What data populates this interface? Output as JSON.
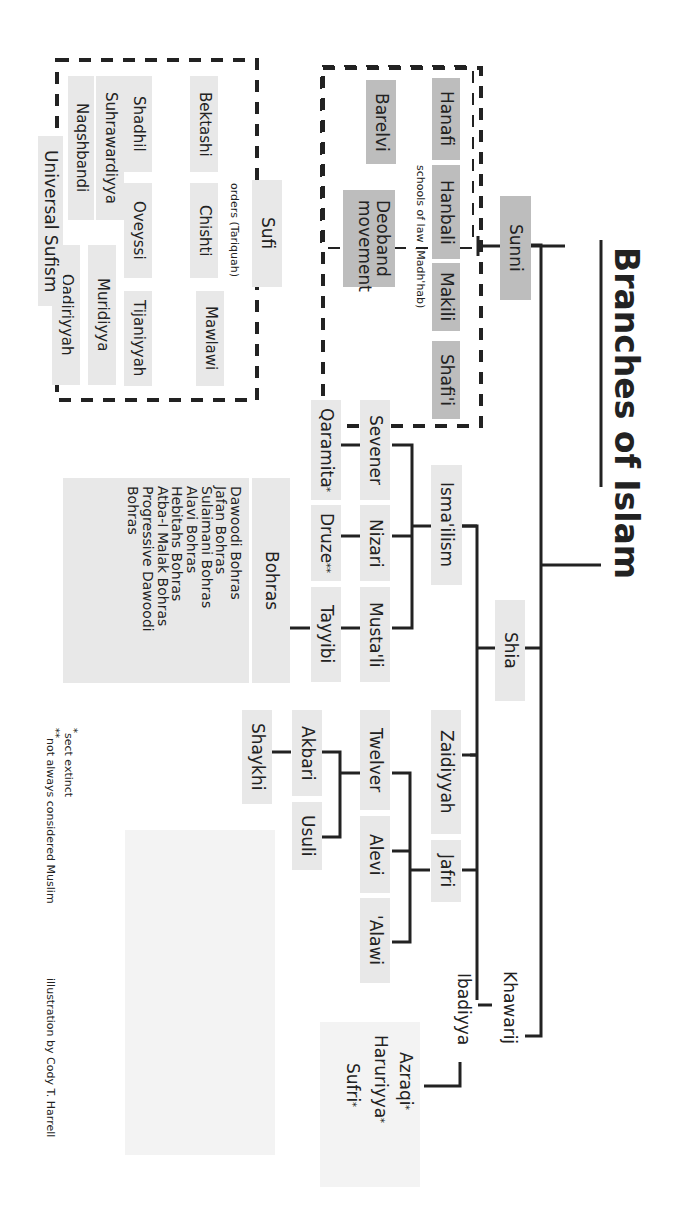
{
  "title": "Branches of Islam",
  "nodes": {
    "sunni": "Sunni",
    "shia": "Shia",
    "khawarij": "Khawarij",
    "schools_caption": "schools of law (Madh'hab)",
    "hanafi": "Hanafi",
    "hanbali": "Hanbali",
    "makili": "Makili",
    "shafii": "Shafi'i",
    "barelvi": "Barelvi",
    "deoband": "Deoband\nmovement",
    "sufi": "Sufi",
    "orders_caption": "orders (Tariquah)",
    "sufi_orders": [
      "Bektashi",
      "Chishti",
      "Mawlawi",
      "Shadhil",
      "Oveyssi",
      "Tijaniyyah",
      "Suhrawardiyya",
      "Muridiyya",
      "Naqshbandi",
      "Qadiriyyah"
    ],
    "universal_sufism": "Universal Sufism",
    "ismailism": "Isma'ilism",
    "sevener": "Sevener",
    "nizari": "Nizari",
    "mustali": "Musta'li",
    "qaramita": "Qaramita",
    "druze": "Druze",
    "tayyibi": "Tayyibi",
    "bohras": "Bohras",
    "bohras_list": "Dawoodi Bohras\nJafan Bohras\nSulaimani Bohras\nAlavi Bohras\nHebitahs Bohras\nAtba-I Malak Bohras\nProgressive Dawoodi\nBohras",
    "zaidiyyah": "Zaidiyyah",
    "jafri": "Jafri",
    "twelver": "Twelver",
    "alevi": "Alevi",
    "alawi": "'Alawi",
    "akbari": "Akbari",
    "usuli": "Usuli",
    "shaykhi": "Shaykhi",
    "ibadiyya": "Ibadiyya",
    "azraqi": "Azraqi",
    "haruriyya": "Haruriyya",
    "sufri": "Sufri"
  },
  "markers": {
    "extinct": "*",
    "not_muslim": "**"
  },
  "legend": {
    "extinct": "sect extinct",
    "not_muslim": "not always considered Muslim"
  },
  "credit": "illustration by Cody T. Harrell",
  "colors": {
    "dark_box": "#bdbdbd",
    "light_box": "#e8e8e8",
    "line": "#222222"
  }
}
